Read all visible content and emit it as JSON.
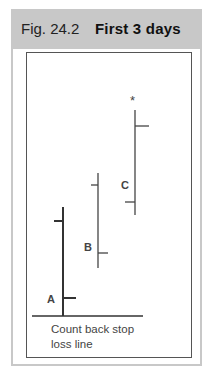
{
  "figure": {
    "number": "Fig. 24.2",
    "title": "First 3 days",
    "caption_line1": "Count back stop",
    "caption_line2": "loss line",
    "marker_symbol": "*",
    "colors": {
      "header_bg": "#c8c8c8",
      "border": "#c8c8c8",
      "bars": "#333333"
    }
  },
  "bars": [
    {
      "label": "A",
      "high_y": 207,
      "low_y": 316,
      "open_y": 221,
      "close_y": 298
    },
    {
      "label": "B",
      "high_y": 173,
      "low_y": 268,
      "open_y": 185,
      "close_y": 253
    },
    {
      "label": "C",
      "high_y": 110,
      "low_y": 215,
      "open_y": 202,
      "close_y": 126
    }
  ]
}
